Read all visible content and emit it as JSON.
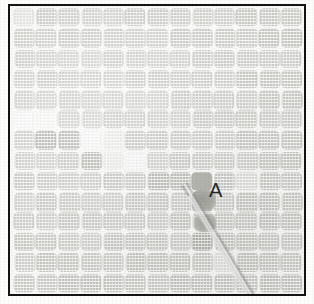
{
  "figure": {
    "kind": "grayscale-scanned-micrograph",
    "border_color": "#151515",
    "background_color": "#f7f7f5",
    "spot_color": "#cfcfcb"
  },
  "annotations": [
    {
      "id": "label-a",
      "text": "A",
      "color": "#17171a",
      "x": 209,
      "y": 180
    }
  ],
  "artifacts": [
    {
      "id": "anomaly",
      "name": "dark-spot-anomaly",
      "x": 182,
      "y": 184,
      "width": 24,
      "height": 20
    },
    {
      "id": "anomaly-2",
      "name": "dark-spot-anomaly-lower",
      "x": 184,
      "y": 208,
      "width": 22,
      "height": 18
    },
    {
      "id": "streak",
      "name": "diagonal-streak-artifact",
      "x": 170,
      "y": 178,
      "angle_deg": -31
    }
  ],
  "chart_data": {
    "type": "heatmap",
    "title": "",
    "xlabel": "",
    "ylabel": "",
    "grid": true,
    "legend": "none",
    "columns": 13,
    "rows": 14,
    "note": "Cell values are relative grayscale intensity classes of each array spot: 0 = hollow/empty, 1 = faint, 2 = light, 3 = mid, 4 = dark, 5 = solid blob",
    "value_classes": {
      "0": "hollow",
      "1": "faint",
      "2": "light",
      "3": "mid",
      "4": "dark",
      "5": "blob"
    },
    "values": [
      [
        2,
        3,
        3,
        3,
        3,
        3,
        3,
        3,
        3,
        3,
        3,
        3,
        3
      ],
      [
        3,
        3,
        3,
        3,
        3,
        3,
        3,
        3,
        3,
        3,
        3,
        3,
        3
      ],
      [
        3,
        3,
        3,
        3,
        3,
        3,
        3,
        3,
        3,
        3,
        3,
        3,
        3
      ],
      [
        3,
        3,
        3,
        3,
        3,
        3,
        3,
        3,
        3,
        3,
        3,
        3,
        3
      ],
      [
        3,
        3,
        3,
        3,
        3,
        3,
        3,
        3,
        3,
        3,
        3,
        3,
        3
      ],
      [
        0,
        0,
        3,
        3,
        3,
        3,
        3,
        3,
        3,
        3,
        3,
        3,
        3
      ],
      [
        3,
        4,
        4,
        0,
        1,
        3,
        3,
        3,
        3,
        3,
        3,
        3,
        3
      ],
      [
        3,
        3,
        3,
        4,
        1,
        0,
        3,
        3,
        3,
        3,
        3,
        3,
        3
      ],
      [
        3,
        3,
        3,
        3,
        3,
        3,
        4,
        4,
        5,
        3,
        2,
        3,
        3
      ],
      [
        3,
        3,
        3,
        3,
        3,
        3,
        3,
        3,
        5,
        3,
        3,
        3,
        3
      ],
      [
        3,
        3,
        3,
        3,
        3,
        3,
        3,
        3,
        3,
        3,
        3,
        3,
        3
      ],
      [
        3,
        3,
        3,
        3,
        3,
        3,
        3,
        3,
        4,
        3,
        3,
        3,
        3
      ],
      [
        3,
        3,
        3,
        3,
        3,
        3,
        3,
        3,
        3,
        2,
        3,
        3,
        3
      ],
      [
        3,
        3,
        3,
        3,
        3,
        3,
        3,
        3,
        3,
        3,
        3,
        3,
        3
      ]
    ]
  }
}
